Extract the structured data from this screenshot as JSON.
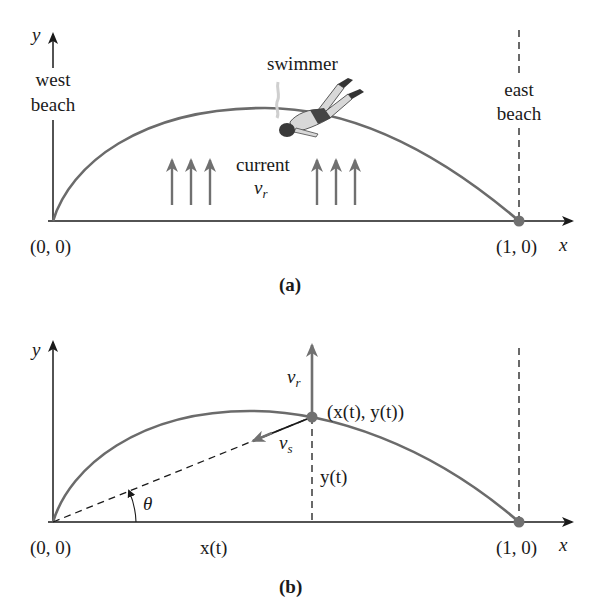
{
  "figure": {
    "panel_a": {
      "caption": "(a)",
      "y_axis_label": "y",
      "x_axis_label": "x",
      "west_beach_line1": "west",
      "west_beach_line2": "beach",
      "east_beach_line1": "east",
      "east_beach_line2": "beach",
      "swimmer_label": "swimmer",
      "current_label": "current",
      "current_symbol": "v",
      "current_subscript": "r",
      "origin_label": "(0, 0)",
      "end_point_label": "(1, 0)",
      "current_arrow_groups": 2,
      "arrows_per_group": 3
    },
    "panel_b": {
      "caption": "(b)",
      "y_axis_label": "y",
      "x_axis_label": "x",
      "vr_symbol": "v",
      "vr_subscript": "r",
      "vs_symbol": "v",
      "vs_subscript": "s",
      "point_label": "(x(t), y(t))",
      "y_of_t_label": "y(t)",
      "x_of_t_label": "x(t)",
      "angle_label": "θ",
      "origin_label": "(0, 0)",
      "end_point_label": "(1, 0)"
    },
    "colors": {
      "curve": "#6b6b6b",
      "axis": "#1a1a1a",
      "point": "#707070",
      "arrow": "#707070"
    }
  }
}
